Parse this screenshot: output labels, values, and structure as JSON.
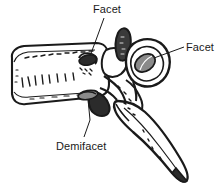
{
  "figure": {
    "background_color": "#ffffff",
    "ink_color": "#1a1a1a",
    "facet_fill_color": "#8a8a8a",
    "dark_fill_color": "#2b2b2b"
  },
  "labels": [
    {
      "id": "facet-superior",
      "text": "Facet",
      "position": "top-center",
      "leader": "diagonal down-left to small dark oval facet on pedicle"
    },
    {
      "id": "facet-transverse",
      "text": "Facet",
      "position": "right",
      "leader": "horizontal left to gray oval facet on transverse process"
    },
    {
      "id": "demifacet",
      "text": "Demifacet",
      "position": "bottom-left",
      "leader": "diagonal up-right to small gray oval at posteroinferior body"
    }
  ],
  "parts": {
    "vertebral_body": "vertebral-body",
    "superior_articular_process": "superior-articular-process",
    "transverse_process": "transverse-process",
    "pedicle": "pedicle",
    "spinous_process": "spinous-process",
    "inferior_articular_process": "inferior-articular-process"
  }
}
